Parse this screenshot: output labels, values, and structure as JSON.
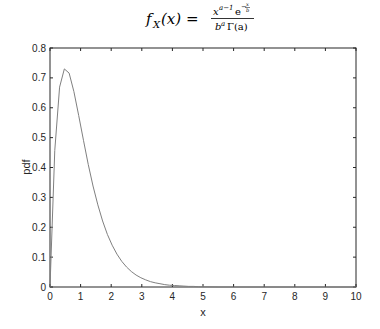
{
  "chart_data": {
    "type": "line",
    "title_parts": {
      "lhs": "f",
      "lhs_sub": "X",
      "lhs_arg": "(x) =",
      "numerator_base": "x",
      "numerator_exp": "a−1",
      "numerator_e": "e",
      "numerator_e_exp": "−",
      "numerator_frac_num": "x",
      "numerator_frac_den": "b",
      "denominator_base": "b",
      "denominator_exp": "a",
      "denominator_gamma": "Γ(a)"
    },
    "xlabel": "x",
    "ylabel": "pdf",
    "xlim": [
      0,
      10
    ],
    "ylim": [
      0,
      0.8
    ],
    "xticks": [
      "0",
      "1",
      "2",
      "3",
      "4",
      "5",
      "6",
      "7",
      "8",
      "9",
      "10"
    ],
    "yticks": [
      "0",
      "0.1",
      "0.2",
      "0.3",
      "0.4",
      "0.5",
      "0.6",
      "0.7",
      "0.8"
    ],
    "grid": false,
    "legend": null,
    "line_color": "#808080",
    "series": [
      {
        "name": "gamma pdf (a≈2, b≈0.5)",
        "x": [
          0,
          0.156,
          0.313,
          0.469,
          0.625,
          0.781,
          0.938,
          1.094,
          1.25,
          1.406,
          1.563,
          1.719,
          1.875,
          2.031,
          2.188,
          2.344,
          2.5,
          2.656,
          2.813,
          2.969,
          3.125,
          3.281,
          3.438,
          3.594,
          3.75,
          3.906,
          4.063,
          4.219,
          4.375,
          4.531,
          4.688,
          4.844,
          5,
          5.5,
          6,
          6.5,
          7,
          7.5,
          8,
          8.5,
          9,
          9.5,
          10
        ],
        "values": [
          0,
          0.457,
          0.669,
          0.73,
          0.716,
          0.654,
          0.574,
          0.491,
          0.41,
          0.338,
          0.275,
          0.221,
          0.176,
          0.14,
          0.11,
          0.086,
          0.067,
          0.052,
          0.04,
          0.031,
          0.024,
          0.018,
          0.014,
          0.011,
          0.008,
          0.006,
          0.005,
          0.004,
          0.003,
          0.002,
          0.002,
          0.001,
          0.001,
          0,
          0,
          0,
          0,
          0,
          0,
          0,
          0,
          0,
          0
        ]
      }
    ]
  }
}
